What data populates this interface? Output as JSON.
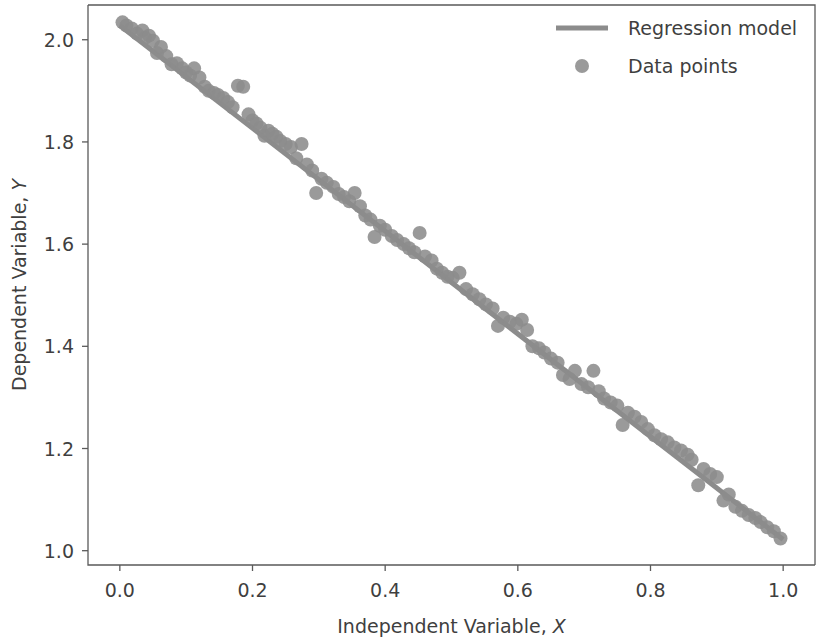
{
  "chart_data": {
    "type": "scatter",
    "title": "",
    "xlabel": "Independent Variable, X",
    "xlabel_text": "Independent Variable, ",
    "xlabel_var": "X",
    "ylabel": "Dependent Variable, Y",
    "ylabel_text": "Dependent Variable, ",
    "ylabel_var": "Y",
    "xlim": [
      -0.048,
      1.048
    ],
    "ylim": [
      0.972,
      2.068
    ],
    "xticks": [
      0.0,
      0.2,
      0.4,
      0.6,
      0.8,
      1.0
    ],
    "xtick_labels": [
      "0.0",
      "0.2",
      "0.4",
      "0.6",
      "0.8",
      "1.0"
    ],
    "yticks": [
      1.0,
      1.2,
      1.4,
      1.6,
      1.8,
      2.0
    ],
    "ytick_labels": [
      "1.0",
      "1.2",
      "1.4",
      "1.6",
      "1.8",
      "2.0"
    ],
    "grid": false,
    "legend_position": "upper right",
    "marker_color": "#8c8c8c",
    "line_color": "#8c8c8c",
    "text_color": "#3f3f3f",
    "marker_size": 7,
    "line_width": 5,
    "series": [
      {
        "name": "Regression model",
        "type": "line",
        "color": "#8c8c8c",
        "endpoints": [
          [
            0.0,
            2.028
          ],
          [
            1.0,
            1.022
          ]
        ],
        "slope": -1.006,
        "intercept": 2.028
      },
      {
        "name": "Data points",
        "type": "scatter",
        "color": "#8c8c8c",
        "points": [
          [
            0.004,
            2.034
          ],
          [
            0.01,
            2.028
          ],
          [
            0.018,
            2.022
          ],
          [
            0.026,
            2.012
          ],
          [
            0.034,
            2.018
          ],
          [
            0.038,
            2.004
          ],
          [
            0.044,
            2.008
          ],
          [
            0.05,
            1.998
          ],
          [
            0.056,
            1.974
          ],
          [
            0.062,
            1.986
          ],
          [
            0.07,
            1.968
          ],
          [
            0.078,
            1.952
          ],
          [
            0.086,
            1.954
          ],
          [
            0.094,
            1.944
          ],
          [
            0.1,
            1.936
          ],
          [
            0.106,
            1.93
          ],
          [
            0.112,
            1.944
          ],
          [
            0.12,
            1.926
          ],
          [
            0.128,
            1.908
          ],
          [
            0.134,
            1.9
          ],
          [
            0.142,
            1.896
          ],
          [
            0.148,
            1.892
          ],
          [
            0.156,
            1.886
          ],
          [
            0.163,
            1.878
          ],
          [
            0.17,
            1.868
          ],
          [
            0.178,
            1.91
          ],
          [
            0.186,
            1.908
          ],
          [
            0.194,
            1.854
          ],
          [
            0.2,
            1.842
          ],
          [
            0.206,
            1.836
          ],
          [
            0.212,
            1.828
          ],
          [
            0.218,
            1.812
          ],
          [
            0.224,
            1.822
          ],
          [
            0.23,
            1.816
          ],
          [
            0.236,
            1.81
          ],
          [
            0.242,
            1.802
          ],
          [
            0.25,
            1.796
          ],
          [
            0.258,
            1.79
          ],
          [
            0.266,
            1.768
          ],
          [
            0.274,
            1.796
          ],
          [
            0.282,
            1.756
          ],
          [
            0.29,
            1.744
          ],
          [
            0.296,
            1.7
          ],
          [
            0.304,
            1.728
          ],
          [
            0.312,
            1.72
          ],
          [
            0.322,
            1.712
          ],
          [
            0.33,
            1.698
          ],
          [
            0.338,
            1.692
          ],
          [
            0.346,
            1.684
          ],
          [
            0.354,
            1.7
          ],
          [
            0.362,
            1.674
          ],
          [
            0.37,
            1.656
          ],
          [
            0.378,
            1.648
          ],
          [
            0.384,
            1.614
          ],
          [
            0.392,
            1.636
          ],
          [
            0.4,
            1.628
          ],
          [
            0.41,
            1.616
          ],
          [
            0.418,
            1.608
          ],
          [
            0.428,
            1.6
          ],
          [
            0.436,
            1.592
          ],
          [
            0.444,
            1.584
          ],
          [
            0.452,
            1.622
          ],
          [
            0.46,
            1.576
          ],
          [
            0.47,
            1.568
          ],
          [
            0.478,
            1.552
          ],
          [
            0.486,
            1.544
          ],
          [
            0.494,
            1.536
          ],
          [
            0.502,
            1.534
          ],
          [
            0.512,
            1.544
          ],
          [
            0.522,
            1.512
          ],
          [
            0.532,
            1.502
          ],
          [
            0.542,
            1.492
          ],
          [
            0.552,
            1.482
          ],
          [
            0.562,
            1.474
          ],
          [
            0.57,
            1.44
          ],
          [
            0.578,
            1.456
          ],
          [
            0.588,
            1.448
          ],
          [
            0.598,
            1.444
          ],
          [
            0.606,
            1.452
          ],
          [
            0.614,
            1.432
          ],
          [
            0.622,
            1.4
          ],
          [
            0.632,
            1.396
          ],
          [
            0.64,
            1.388
          ],
          [
            0.65,
            1.376
          ],
          [
            0.66,
            1.368
          ],
          [
            0.668,
            1.344
          ],
          [
            0.678,
            1.336
          ],
          [
            0.686,
            1.352
          ],
          [
            0.696,
            1.326
          ],
          [
            0.706,
            1.32
          ],
          [
            0.714,
            1.352
          ],
          [
            0.722,
            1.312
          ],
          [
            0.73,
            1.298
          ],
          [
            0.74,
            1.29
          ],
          [
            0.75,
            1.284
          ],
          [
            0.758,
            1.246
          ],
          [
            0.766,
            1.27
          ],
          [
            0.776,
            1.262
          ],
          [
            0.786,
            1.252
          ],
          [
            0.796,
            1.238
          ],
          [
            0.806,
            1.226
          ],
          [
            0.816,
            1.218
          ],
          [
            0.826,
            1.212
          ],
          [
            0.836,
            1.202
          ],
          [
            0.846,
            1.196
          ],
          [
            0.856,
            1.188
          ],
          [
            0.862,
            1.178
          ],
          [
            0.872,
            1.128
          ],
          [
            0.88,
            1.16
          ],
          [
            0.89,
            1.15
          ],
          [
            0.9,
            1.144
          ],
          [
            0.91,
            1.098
          ],
          [
            0.918,
            1.11
          ],
          [
            0.928,
            1.086
          ],
          [
            0.938,
            1.078
          ],
          [
            0.948,
            1.07
          ],
          [
            0.958,
            1.064
          ],
          [
            0.966,
            1.056
          ],
          [
            0.976,
            1.046
          ],
          [
            0.986,
            1.038
          ],
          [
            0.996,
            1.024
          ]
        ]
      }
    ],
    "legend": [
      {
        "label": "Regression model",
        "marker": "line",
        "color": "#8c8c8c"
      },
      {
        "label": "Data points",
        "marker": "circle",
        "color": "#8c8c8c"
      }
    ]
  }
}
